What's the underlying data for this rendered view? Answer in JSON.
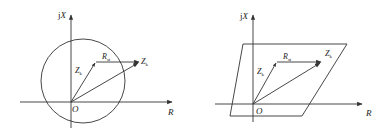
{
  "diagrams": [
    {
      "id": "circle",
      "axis_y_label_prefix": "j",
      "axis_y_label_var": "X",
      "axis_x_label": "R",
      "origin_label": "O",
      "vector_zk_label": "Z",
      "vector_zk_sub": "k",
      "vector_rst_label": "R",
      "vector_rst_sub": "st",
      "vector_total_label": "Z",
      "vector_total_sub": "k",
      "boundary_shape": "circle"
    },
    {
      "id": "parallelogram",
      "axis_y_label_prefix": "j",
      "axis_y_label_var": "X",
      "axis_x_label": "R",
      "origin_label": "O",
      "vector_zk_label": "Z",
      "vector_zk_sub": "k",
      "vector_rst_label": "R",
      "vector_rst_sub": "st",
      "vector_total_label": "Z",
      "vector_total_sub": "k",
      "boundary_shape": "parallelogram"
    }
  ],
  "colors": {
    "line": "#333333",
    "background": "#ffffff"
  }
}
